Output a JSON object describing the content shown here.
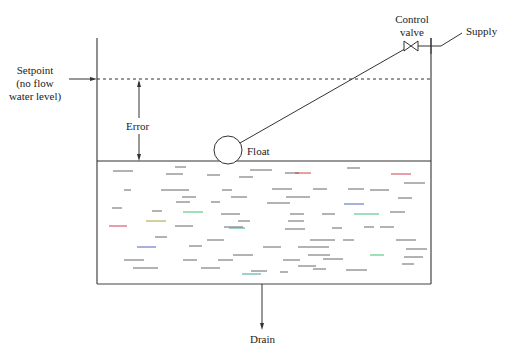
{
  "diagram": {
    "labels": {
      "setpoint_line1": "Setpoint",
      "setpoint_line2": "(no flow",
      "setpoint_line3": "water level)",
      "control_valve_line1": "Control",
      "control_valve_line2": "valve",
      "supply": "Supply",
      "error": "Error",
      "float": "Float",
      "drain": "Drain"
    },
    "colors": {
      "stroke": "#333333",
      "water_dash_default": "#555555",
      "water_dash_red": "#d04050",
      "water_dash_green": "#40c070",
      "water_dash_blue": "#5060c0",
      "water_dash_teal": "#40a0a0",
      "water_dash_olive": "#a0a040"
    },
    "components": [
      "tank",
      "setpoint-line",
      "water-surface",
      "float",
      "float-linkage",
      "control-valve",
      "supply-pipe",
      "drain-pipe",
      "error-arrow"
    ]
  }
}
